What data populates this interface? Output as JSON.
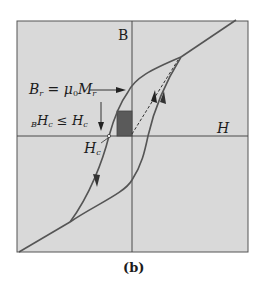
{
  "figure": {
    "panel_label": "(b)",
    "axes": {
      "x_label": "H",
      "y_label": "B"
    },
    "annotations": {
      "remanence": {
        "lhs_main": "B",
        "lhs_sub": "r",
        "eq": " = ",
        "mu": "μ",
        "mu_sub": "0",
        "rhs_main": "M",
        "rhs_sub": "r"
      },
      "coercivity_relation": {
        "pre_sub": "B",
        "left": "H",
        "left_sub": "c",
        "op": " ≤ ",
        "right": "H",
        "right_sub": "c"
      },
      "coercivity_point": {
        "main": "H",
        "sub": "c"
      }
    },
    "colors": {
      "background_box": "#d9d9d9",
      "curve": "#555555",
      "axis": "#4a4a4a",
      "rectangle": "#555555"
    }
  }
}
